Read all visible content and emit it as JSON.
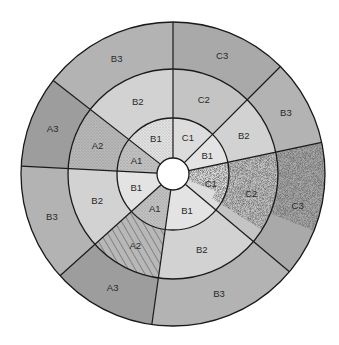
{
  "diagram": {
    "type": "polar-bullseye",
    "center": [
      173,
      174
    ],
    "radii": {
      "hole": 16,
      "inner": 56,
      "middle": 105,
      "outer": 152
    },
    "colors": {
      "A3": "#9d9d9d",
      "B3": "#b3b3b3",
      "C3": "#a9a9a9",
      "A2": "#b8b8b8",
      "B2": "#d2d2d2",
      "C2": "#c4c4c4",
      "A1": "#c2c2c2",
      "B1": "#e3e3e3",
      "C1": "#dcdcdc",
      "stipple": "#6a6a6a",
      "stroke": "#1a1a1a",
      "hole": "#ffffff"
    },
    "sectors": [
      {
        "start": 270,
        "end": 315,
        "labels": [
          "C1",
          "C2",
          "C3"
        ],
        "patterns": [
          "none",
          "none",
          "none"
        ]
      },
      {
        "start": 315,
        "end": 348,
        "labels": [
          "B1",
          "B2",
          "B3"
        ],
        "patterns": [
          "none",
          "none",
          "none"
        ]
      },
      {
        "start": 348,
        "end": 400,
        "labels": [
          "C1",
          "C2",
          "C3"
        ],
        "patterns": [
          "dense-stipple",
          "dense-stipple",
          "dense-stipple"
        ]
      },
      {
        "start": 40,
        "end": 98,
        "labels": [
          "B1",
          "B2",
          "B3"
        ],
        "patterns": [
          "none",
          "none",
          "none"
        ]
      },
      {
        "start": 98,
        "end": 138,
        "labels": [
          "A1",
          "A2",
          "A3"
        ],
        "patterns": [
          "fine-dots",
          "hatch",
          "none"
        ]
      },
      {
        "start": 138,
        "end": 183,
        "labels": [
          "B1",
          "B2",
          "B3"
        ],
        "patterns": [
          "none",
          "none",
          "none"
        ]
      },
      {
        "start": 183,
        "end": 218,
        "labels": [
          "A1",
          "A2",
          "A3"
        ],
        "patterns": [
          "fine-dots",
          "fine-dots",
          "none"
        ]
      },
      {
        "start": 218,
        "end": 270,
        "labels": [
          "B1",
          "B2",
          "B3"
        ],
        "patterns": [
          "fine-dots",
          "none",
          "none"
        ]
      }
    ]
  }
}
